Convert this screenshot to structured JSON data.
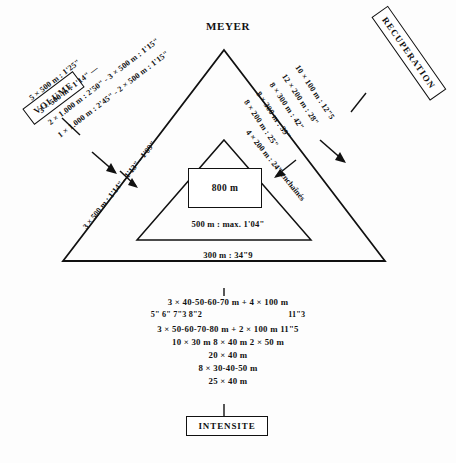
{
  "title": "MEYER",
  "labels": {
    "volume": "VOLUME",
    "recuperation": "RECUPERATION",
    "intensite": "INTENSITE"
  },
  "center_box": {
    "value": "800 m"
  },
  "inner_captions": {
    "line_500": "500 m : max. 1'04\"",
    "line_300": "300 m : 34\"9"
  },
  "inner_diagonals": {
    "left": "3 × 500 m : 1'14\" - 1'13\" - 1'09\"",
    "right": "4 × 200 m : 24\" enchaînés"
  },
  "volume_lines": [
    "5 × 500 m : 1'25\"",
    "3 × 500 m : 1'14\" —",
    "2 × 1.000 m : 2'50\" - 3 × 500 m : 1'15\"",
    "1 × 1.000 m : 2'45\" - 2 × 500 m : 1'15\""
  ],
  "recuperation_lines": [
    "10 × 100 m : 12\"5",
    "12 × 200 m : 28\"",
    "8 × 300 m : 42\"",
    "8 × 300 m : 39\"",
    "8 × 200 m : 25\""
  ],
  "intensite_lines": [
    {
      "type": "main",
      "text": "3  ×  40-50-60-70 m  +  4  ×  100 m"
    },
    {
      "type": "sub",
      "left": "5\" 6\" 7\"3 8\"2",
      "right": "11\"3"
    },
    {
      "type": "main",
      "text": "3  ×  50-60-70-80 m  +  2  ×  100 m  11\"5"
    },
    {
      "type": "main",
      "text": "10  ×  30 m   8  ×  40 m   2  ×  50 m"
    },
    {
      "type": "main",
      "text": "20  ×  40 m"
    },
    {
      "type": "main",
      "text": "8  ×  30-40-50 m"
    },
    {
      "type": "main",
      "text": "25  ×  40 m"
    }
  ],
  "colors": {
    "ink": "#111111",
    "paper": "#fdfdfd"
  }
}
